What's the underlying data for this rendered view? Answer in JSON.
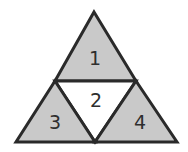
{
  "diagram": {
    "type": "subdivided-triangle",
    "colors": {
      "shaded_fill": "#c9c9c9",
      "unshaded_fill": "#ffffff",
      "stroke": "#2a2a2a",
      "label": "#2e2e2e"
    },
    "vertices": {
      "apex": [
        94,
        12
      ],
      "bottom_left": [
        16,
        142
      ],
      "bottom_right": [
        177,
        142
      ],
      "mid_left": [
        55,
        81
      ],
      "mid_right": [
        136,
        81
      ],
      "mid_bottom": [
        95,
        142
      ]
    },
    "regions": [
      {
        "id": "1",
        "label": "1",
        "shaded": true,
        "label_pos": [
          95,
          58
        ]
      },
      {
        "id": "2",
        "label": "2",
        "shaded": false,
        "label_pos": [
          96,
          100
        ]
      },
      {
        "id": "3",
        "label": "3",
        "shaded": true,
        "label_pos": [
          55,
          122
        ]
      },
      {
        "id": "4",
        "label": "4",
        "shaded": true,
        "label_pos": [
          140,
          122
        ]
      }
    ]
  }
}
